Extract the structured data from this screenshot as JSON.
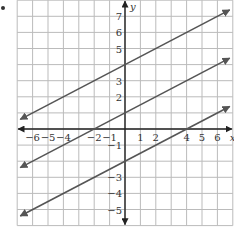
{
  "chart_data": {
    "type": "line",
    "title": "",
    "xlabel": "x",
    "ylabel": "y",
    "xlim": [
      -7,
      7
    ],
    "ylim": [
      -6,
      8
    ],
    "grid": true,
    "x_tick_labels": [
      "-6",
      "-5",
      "-4",
      "-2",
      "-1",
      "1",
      "2",
      "4",
      "5",
      "6"
    ],
    "y_tick_labels": [
      "7",
      "6",
      "5",
      "3",
      "2",
      "-1",
      "-3",
      "-4",
      "-5"
    ],
    "series": [
      {
        "name": "line_top",
        "slope": 0.5,
        "intercept": 4,
        "points": [
          [
            -6.8,
            0.6
          ],
          [
            6.8,
            7.4
          ]
        ]
      },
      {
        "name": "line_middle",
        "slope": 0.5,
        "intercept": 1,
        "points": [
          [
            -6.8,
            -2.4
          ],
          [
            6.8,
            4.4
          ]
        ]
      },
      {
        "name": "line_bottom",
        "slope": 0.5,
        "intercept": -2,
        "points": [
          [
            -6.8,
            -5.4
          ],
          [
            6.8,
            1.4
          ]
        ]
      }
    ],
    "line_color": "#555555",
    "axis_color": "#222222",
    "grid_color": "#bbbbbb"
  }
}
